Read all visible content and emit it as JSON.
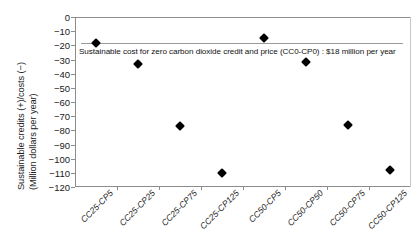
{
  "chart_data": {
    "type": "scatter",
    "title": "",
    "xlabel": "",
    "ylabel_line1": "Sustainable credits (+)/costs (−)",
    "ylabel_line2": "(Million dollars per year)",
    "categories": [
      "CC25-CP5",
      "CC25-CP25",
      "CC25-CP75",
      "CC25-CP125",
      "CC50-CP5",
      "CC50-CP50",
      "CC50-CP75",
      "CC50-CP125"
    ],
    "values": [
      -18,
      -33,
      -77,
      -110,
      -15,
      -32,
      -76,
      -108
    ],
    "ylim": [
      -120,
      0
    ],
    "yticks": [
      0,
      -10,
      -20,
      -30,
      -40,
      -50,
      -60,
      -70,
      -80,
      -90,
      -100,
      -110,
      -120
    ],
    "ytick_labels": [
      "0",
      "−10",
      "−20",
      "−30",
      "−40",
      "−50",
      "−60",
      "−70",
      "−80",
      "−90",
      "−100",
      "−110",
      "−120"
    ],
    "grid": false,
    "legend": false,
    "marker_shape": "filled-diamond",
    "marker_color": "#000000",
    "reference_line": {
      "value": -18,
      "color": "#9a9a9a",
      "label": "Sustainable cost for zero carbon dioxide credit and price (CC0-CP0) : $18 million per year"
    },
    "annotation": "Sustainable cost for zero carbon dioxide credit and price (CC0-CP0) : $18 million per year"
  },
  "axis_color": "#8c8c8c"
}
